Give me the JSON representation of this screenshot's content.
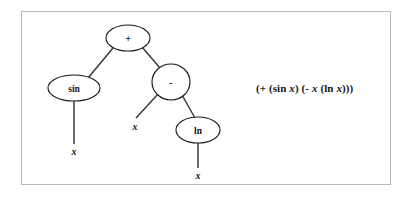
{
  "figure": {
    "kind": "expression-tree-diagram",
    "border_color": "#b9b9b9",
    "background_color": "#ffffff"
  },
  "tree": {
    "nodes": [
      {
        "id": "root",
        "label": "+",
        "shape": "ellipse",
        "cx": 128,
        "cy": 38,
        "rx": 22,
        "ry": 13,
        "kind": "operator"
      },
      {
        "id": "sin",
        "label": "sin",
        "shape": "ellipse",
        "cx": 74,
        "cy": 88,
        "rx": 26,
        "ry": 13,
        "kind": "function"
      },
      {
        "id": "minus",
        "label": "-",
        "shape": "circle",
        "cx": 171,
        "cy": 82,
        "rx": 19,
        "ry": 18,
        "kind": "operator"
      },
      {
        "id": "ln",
        "label": "ln",
        "shape": "ellipse",
        "cx": 198,
        "cy": 130,
        "rx": 22,
        "ry": 13,
        "kind": "function"
      }
    ],
    "leaves": [
      {
        "id": "x-sin",
        "label": "x",
        "x": 74,
        "y": 151
      },
      {
        "id": "x-minus",
        "label": "x",
        "x": 135,
        "y": 126
      },
      {
        "id": "x-ln",
        "label": "x",
        "x": 198,
        "y": 175
      }
    ],
    "edges": [
      {
        "from": "root",
        "to": "sin",
        "x1": 113,
        "y1": 48,
        "x2": 88,
        "y2": 78
      },
      {
        "from": "root",
        "to": "minus",
        "x1": 142,
        "y1": 47,
        "x2": 160,
        "y2": 68
      },
      {
        "from": "minus",
        "to": "x-minus",
        "x1": 159,
        "y1": 93,
        "x2": 136,
        "y2": 118
      },
      {
        "from": "minus",
        "to": "ln",
        "x1": 182,
        "y1": 95,
        "x2": 195,
        "y2": 118
      },
      {
        "from": "sin",
        "to": "x-sin",
        "x1": 74,
        "y1": 101,
        "x2": 74,
        "y2": 144
      },
      {
        "from": "ln",
        "to": "x-ln",
        "x1": 198,
        "y1": 143,
        "x2": 198,
        "y2": 168
      }
    ]
  },
  "expression": {
    "full_text": "(+ (sin x) (- x (ln x)))",
    "tokens": [
      {
        "text": "(+ (",
        "style": "bold"
      },
      {
        "text": "sin",
        "style": "bold"
      },
      {
        "text": " ",
        "style": "bold"
      },
      {
        "text": "x",
        "style": "bold-italic"
      },
      {
        "text": ") (- ",
        "style": "bold"
      },
      {
        "text": "x",
        "style": "bold-italic"
      },
      {
        "text": " (",
        "style": "bold"
      },
      {
        "text": "ln",
        "style": "bold"
      },
      {
        "text": " ",
        "style": "bold"
      },
      {
        "text": "x",
        "style": "bold-italic"
      },
      {
        "text": ")))",
        "style": "bold"
      }
    ],
    "parts": {
      "p1": "(+ (sin ",
      "v1": "x",
      "p2": ") (- ",
      "v2": "x",
      "p3": " (ln ",
      "v3": "x",
      "p4": ")))"
    }
  }
}
